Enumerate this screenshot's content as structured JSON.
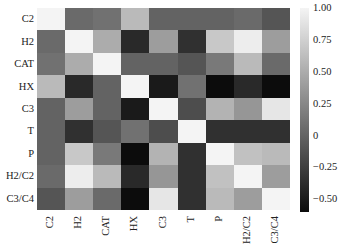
{
  "chart_data": {
    "type": "heatmap",
    "title": "",
    "xlabel": "",
    "ylabel": "",
    "labels": [
      "C2",
      "H2",
      "CAT",
      "HX",
      "C3",
      "T",
      "P",
      "H2/C2",
      "C3/C4"
    ],
    "matrix": [
      [
        1.0,
        0.05,
        0.1,
        0.6,
        0.0,
        0.0,
        0.0,
        0.05,
        -0.1
      ],
      [
        0.05,
        1.0,
        0.5,
        -0.4,
        0.4,
        -0.35,
        0.7,
        0.95,
        0.4
      ],
      [
        0.1,
        0.5,
        1.0,
        0.0,
        0.0,
        -0.1,
        0.15,
        0.6,
        0.05
      ],
      [
        0.6,
        -0.4,
        0.0,
        1.0,
        -0.5,
        0.1,
        -0.6,
        -0.4,
        -0.6
      ],
      [
        0.0,
        0.4,
        0.0,
        -0.5,
        1.0,
        -0.15,
        0.55,
        0.35,
        0.9
      ],
      [
        0.0,
        -0.35,
        -0.1,
        0.1,
        -0.15,
        1.0,
        -0.35,
        -0.35,
        -0.35
      ],
      [
        0.0,
        0.7,
        0.15,
        -0.6,
        0.55,
        -0.35,
        1.0,
        0.65,
        0.6
      ],
      [
        0.05,
        0.95,
        0.6,
        -0.4,
        0.35,
        -0.35,
        0.65,
        1.0,
        0.4
      ],
      [
        -0.1,
        0.4,
        0.05,
        -0.6,
        0.9,
        -0.35,
        0.6,
        0.4,
        1.0
      ]
    ],
    "colorbar": {
      "min": -0.6,
      "max": 1.0,
      "ticks": [
        "1.00",
        "0.75",
        "0.50",
        "0.25",
        "0",
        "−0.25",
        "−0.50"
      ],
      "tick_values": [
        1.0,
        0.75,
        0.5,
        0.25,
        0,
        -0.25,
        -0.5
      ],
      "colormap": "grayscale (black = low, white = high)"
    },
    "grid": false,
    "legend_position": "right (colorbar)"
  }
}
